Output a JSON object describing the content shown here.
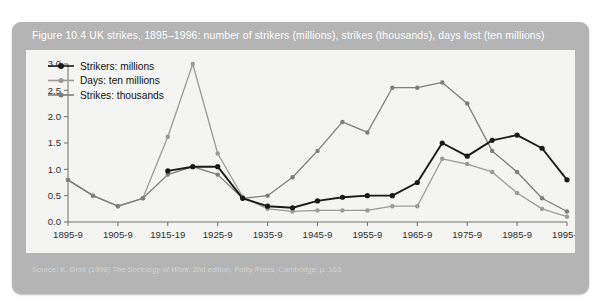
{
  "figure": {
    "caption": "Figure 10.4  UK strikes, 1895–1996: number of strikers (millions), strikes (thousands), days lost (ten millions)",
    "source_prefix": "Source: K. Grint (1998) ",
    "source_italic": "The Sociology of Work",
    "source_suffix": ", 2nd edition, Polity Press, Cambridge; p. 163."
  },
  "colors": {
    "panel": "#b4b4b4",
    "plot_background": "#f4f4f2",
    "caption_text": "#ffffff",
    "strikers": "#1a1a1a",
    "days": "#9a9a9a",
    "strikes": "#7d7d7d",
    "axis": "#6f6f6f"
  },
  "legend": {
    "position": "top-left",
    "entries": [
      {
        "label": "Strikers: millions",
        "color": "#1a1a1a"
      },
      {
        "label": "Days: ten millions",
        "color": "#9a9a9a"
      },
      {
        "label": "Strikes: thousands",
        "color": "#7d7d7d"
      }
    ]
  },
  "chart_data": {
    "type": "line",
    "title": "UK strikes, 1895–1996: number of strikers (millions), strikes (thousands), days lost (ten millions)",
    "xlabel": "",
    "ylabel": "",
    "ylim": [
      0.0,
      3.0
    ],
    "yticks": [
      "0.0",
      "0.5",
      "1.0",
      "1.5",
      "2.0",
      "2.5",
      "3.0"
    ],
    "ytick_values": [
      0.0,
      0.5,
      1.0,
      1.5,
      2.0,
      2.5,
      3.0
    ],
    "grid": false,
    "x": [
      1895,
      1900,
      1905,
      1910,
      1915,
      1920,
      1925,
      1930,
      1935,
      1940,
      1945,
      1950,
      1955,
      1960,
      1965,
      1970,
      1975,
      1980,
      1985,
      1990,
      1995
    ],
    "xtick_labels": [
      "1895-9",
      "1905-9",
      "1915-19",
      "1925-9",
      "1935-9",
      "1945-9",
      "1955-9",
      "1965-9",
      "1975-9",
      "1985-9",
      "1995-6"
    ],
    "xtick_values": [
      1895,
      1905,
      1915,
      1925,
      1935,
      1945,
      1955,
      1965,
      1975,
      1985,
      1995
    ],
    "series": [
      {
        "name": "Strikers: millions",
        "color": "#1a1a1a",
        "values": [
          null,
          null,
          null,
          null,
          0.97,
          1.05,
          1.05,
          0.45,
          0.3,
          0.27,
          0.4,
          0.47,
          0.5,
          0.5,
          0.75,
          1.5,
          1.25,
          1.55,
          1.65,
          1.4,
          0.8
        ]
      },
      {
        "name": "Days: ten millions",
        "color": "#9a9a9a",
        "values": [
          0.8,
          0.5,
          0.3,
          0.45,
          1.62,
          3.0,
          1.3,
          0.48,
          0.25,
          0.2,
          0.22,
          0.22,
          0.22,
          0.3,
          0.3,
          1.2,
          1.1,
          0.95,
          0.55,
          0.25,
          0.1
        ]
      },
      {
        "name": "Strikes: thousands",
        "color": "#7d7d7d",
        "values": [
          0.8,
          0.5,
          0.3,
          0.45,
          0.9,
          1.05,
          0.9,
          0.45,
          0.5,
          0.85,
          1.35,
          1.9,
          1.7,
          2.55,
          2.55,
          2.65,
          2.25,
          1.35,
          0.95,
          0.45,
          0.2
        ]
      }
    ],
    "series_tail": {
      "strikers_end": [
        1985,
        1990,
        1995
      ],
      "note": "all three series converge near zero by 1995-6"
    }
  }
}
